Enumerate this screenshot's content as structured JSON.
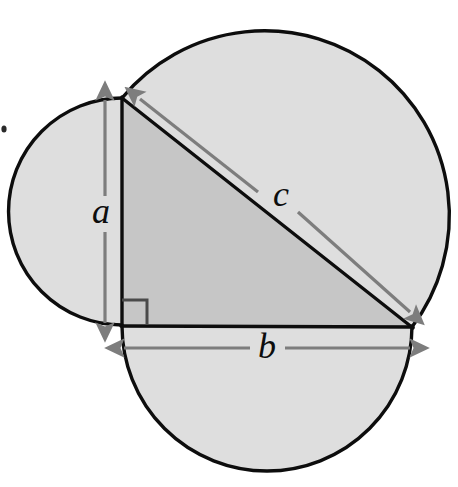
{
  "figure": {
    "type": "geometric-diagram",
    "canvas": {
      "width": 458,
      "height": 487,
      "background": "#ffffff"
    },
    "colors": {
      "stroke": "#0d0d0d",
      "triangle_fill": "#c6c6c6",
      "semicircle_fill": "#dedede",
      "arrow_gray": "#7d7d7d",
      "right_angle_marker": "#4a4a4a",
      "label_color": "#0d0d0d"
    },
    "triangle": {
      "name": "right-triangle",
      "vertices": {
        "top": {
          "x": 122,
          "y": 98
        },
        "right_angle": {
          "x": 122,
          "y": 325
        },
        "right": {
          "x": 412,
          "y": 327
        }
      },
      "sides": {
        "a": {
          "label": "a",
          "kind": "leg-vertical",
          "length_px": 227
        },
        "b": {
          "label": "b",
          "kind": "leg-horizontal",
          "length_px": 290
        },
        "c": {
          "label": "c",
          "kind": "hypotenuse",
          "length_px": 370
        }
      },
      "right_angle_marker": {
        "name": "right-angle-square",
        "x": 122,
        "y": 300,
        "size": 25
      }
    },
    "semicircles": [
      {
        "name": "semicircle-on-a",
        "side": "a",
        "center": {
          "x": 122,
          "y": 211.5
        },
        "radius": 113.5,
        "bulge": "left"
      },
      {
        "name": "semicircle-on-b",
        "side": "b",
        "center": {
          "x": 267,
          "y": 326
        },
        "radius": 145,
        "bulge": "down"
      },
      {
        "name": "semicircle-on-c",
        "side": "c",
        "center": {
          "x": 267,
          "y": 212.5
        },
        "radius": 184.8,
        "bulge": "up-right"
      }
    ],
    "dimension_arrows": [
      {
        "name": "dimension-arrow-a",
        "label": "a",
        "from": {
          "x": 105,
          "y": 100
        },
        "to": {
          "x": 105,
          "y": 323
        },
        "double_headed": true,
        "label_pos": {
          "x": 101,
          "y": 214
        }
      },
      {
        "name": "dimension-arrow-b",
        "label": "b",
        "from": {
          "x": 124,
          "y": 348
        },
        "to": {
          "x": 410,
          "y": 348
        },
        "double_headed": true,
        "label_pos": {
          "x": 267,
          "y": 350
        }
      },
      {
        "name": "dimension-arrow-c",
        "label": "c",
        "from": {
          "x": 140,
          "y": 99
        },
        "to": {
          "x": 410,
          "y": 312
        },
        "double_headed": true,
        "label_pos": {
          "x": 281,
          "y": 197
        }
      }
    ],
    "labels": {
      "a": "a",
      "b": "b",
      "c": "c"
    },
    "artifacts": [
      {
        "name": "scan-speck",
        "x": 3,
        "y": 128,
        "width": 5,
        "height": 7
      }
    ]
  }
}
